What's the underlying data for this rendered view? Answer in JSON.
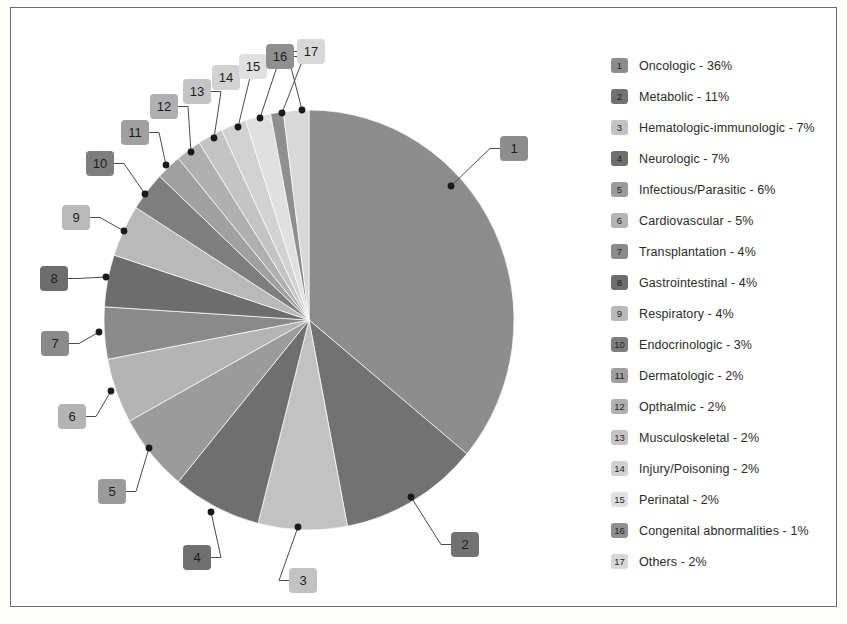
{
  "figure": {
    "frame_border_color": "#6e6e6e",
    "background": "#ffffff"
  },
  "chart_data": {
    "type": "pie",
    "title": "",
    "xlabel": "",
    "ylabel": "",
    "legend_position": "right",
    "grid": false,
    "start_angle_deg": 0,
    "direction": "clockwise",
    "units": "percent",
    "categories": [
      "Oncologic",
      "Metabolic",
      "Hematologic-immunologic",
      "Neurologic",
      "Infectious/Parasitic",
      "Cardiovascular",
      "Transplantation",
      "Gastrointestinal",
      "Respiratory",
      "Endocrinologic",
      "Dermatologic",
      "Opthalmic",
      "Musculoskeletal",
      "Injury/Poisoning",
      "Perinatal",
      "Congenital abnormalities",
      "Others"
    ],
    "values": [
      36,
      11,
      7,
      7,
      6,
      5,
      4,
      4,
      4,
      3,
      2,
      2,
      2,
      2,
      2,
      1,
      2
    ],
    "colors": [
      "#8d8d8d",
      "#727272",
      "#c2c2c2",
      "#6f6f6f",
      "#9b9b9b",
      "#b4b4b4",
      "#8a8a8a",
      "#6d6d6d",
      "#b9b9b9",
      "#7e7e7e",
      "#a0a0a0",
      "#b0b0b0",
      "#c4c4c4",
      "#d2d2d2",
      "#e0e0e0",
      "#8f8f8f",
      "#d8d8d8"
    ],
    "total": 100
  },
  "legend": {
    "items": [
      {
        "index": "1",
        "label": "Oncologic - 36%"
      },
      {
        "index": "2",
        "label": "Metabolic - 11%"
      },
      {
        "index": "3",
        "label": "Hematologic-immunologic - 7%"
      },
      {
        "index": "4",
        "label": "Neurologic - 7%"
      },
      {
        "index": "5",
        "label": "Infectious/Parasitic - 6%"
      },
      {
        "index": "6",
        "label": "Cardiovascular - 5%"
      },
      {
        "index": "7",
        "label": "Transplantation - 4%"
      },
      {
        "index": "8",
        "label": "Gastrointestinal - 4%"
      },
      {
        "index": "9",
        "label": "Respiratory - 4%"
      },
      {
        "index": "10",
        "label": "Endocrinologic - 3%"
      },
      {
        "index": "11",
        "label": "Dermatologic - 2%"
      },
      {
        "index": "12",
        "label": "Opthalmic - 2%"
      },
      {
        "index": "13",
        "label": "Musculoskeletal - 2%"
      },
      {
        "index": "14",
        "label": "Injury/Poisoning - 2%"
      },
      {
        "index": "15",
        "label": "Perinatal - 2%"
      },
      {
        "index": "16",
        "label": "Congenital abnormalities - 1%"
      },
      {
        "index": "17",
        "label": "Others - 2%"
      }
    ]
  },
  "callouts": [
    {
      "index": "1",
      "box_x": 489,
      "box_y": 128,
      "dot_x": 440,
      "dot_y": 178
    },
    {
      "index": "2",
      "box_x": 440,
      "box_y": 524,
      "dot_x": 400,
      "dot_y": 489
    },
    {
      "index": "3",
      "box_x": 278,
      "box_y": 560,
      "dot_x": 287,
      "dot_y": 519
    },
    {
      "index": "4",
      "box_x": 172,
      "box_y": 537,
      "dot_x": 200,
      "dot_y": 504
    },
    {
      "index": "5",
      "box_x": 87,
      "box_y": 471,
      "dot_x": 138,
      "dot_y": 440
    },
    {
      "index": "6",
      "box_x": 47,
      "box_y": 396,
      "dot_x": 100,
      "dot_y": 383
    },
    {
      "index": "7",
      "box_x": 30,
      "box_y": 323,
      "dot_x": 88,
      "dot_y": 324
    },
    {
      "index": "8",
      "box_x": 29,
      "box_y": 258,
      "dot_x": 95,
      "dot_y": 269
    },
    {
      "index": "9",
      "box_x": 51,
      "box_y": 197,
      "dot_x": 113,
      "dot_y": 223
    },
    {
      "index": "10",
      "box_x": 75,
      "box_y": 143,
      "dot_x": 134,
      "dot_y": 186
    },
    {
      "index": "11",
      "box_x": 110,
      "box_y": 112,
      "dot_x": 155,
      "dot_y": 157
    },
    {
      "index": "12",
      "box_x": 139,
      "box_y": 86,
      "dot_x": 180,
      "dot_y": 144
    },
    {
      "index": "13",
      "box_x": 172,
      "box_y": 71,
      "dot_x": 203,
      "dot_y": 130
    },
    {
      "index": "14",
      "box_x": 201,
      "box_y": 57,
      "dot_x": 227,
      "dot_y": 119
    },
    {
      "index": "15",
      "box_x": 228,
      "box_y": 46,
      "dot_x": 249,
      "dot_y": 110
    },
    {
      "index": "16",
      "box_x": 255,
      "box_y": 36,
      "dot_x": 271,
      "dot_y": 105
    },
    {
      "index": "17",
      "box_x": 286,
      "box_y": 31,
      "dot_x": 291,
      "dot_y": 102
    }
  ],
  "pie_geometry": {
    "center_x": 298,
    "center_y": 312,
    "radius_x": 205,
    "radius_y": 210
  }
}
